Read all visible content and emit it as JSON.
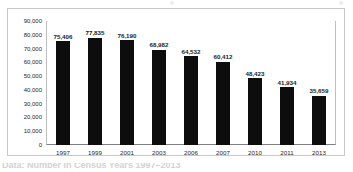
{
  "chart_data": {
    "type": "bar",
    "title": "",
    "xlabel": "",
    "ylabel": "",
    "categories": [
      "1997",
      "1999",
      "2001",
      "2003",
      "2006",
      "2007",
      "2010",
      "2011",
      "2013"
    ],
    "values": [
      75406,
      77835,
      76190,
      68982,
      64532,
      60412,
      48423,
      41934,
      35659
    ],
    "data_labels": [
      "75,406",
      "77,835",
      "76,190",
      "68,982",
      "64,532",
      "60,412",
      "48,423",
      "41,934",
      "35,659"
    ],
    "ylim": [
      0,
      90000
    ],
    "ytick_labels": [
      "90,000",
      "80,000",
      "70,000",
      "60,000",
      "50,000",
      "40,000",
      "30,000",
      "20,000",
      "10,000",
      "0"
    ],
    "ytick_values": [
      90000,
      80000,
      70000,
      60000,
      50000,
      40000,
      30000,
      20000,
      10000,
      0
    ],
    "grid": false,
    "legend": "none",
    "series_color": "#0d0d0d"
  },
  "footer": {
    "caption_fragment": "Data: Number in Census Years 1997–2013"
  },
  "colors": {
    "bar": "#0d0d0d",
    "frame": "#c9c9c9",
    "axis": "#808080",
    "text": "#262626"
  }
}
